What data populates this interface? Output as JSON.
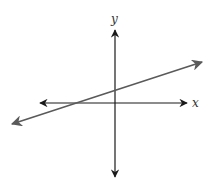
{
  "diagram": {
    "type": "coordinate-plane-line",
    "axes": {
      "x_label": "x",
      "y_label": "y",
      "color": "#1a1a1a",
      "origin_px": [
        115,
        103
      ],
      "x_axis_px": [
        40,
        187
      ],
      "y_axis_px": [
        30,
        177
      ]
    },
    "line": {
      "color": "#5a5a5a",
      "start_px": [
        12,
        124
      ],
      "end_px": [
        202,
        62
      ],
      "slope_sign": "positive",
      "y_intercept": "positive",
      "x_intercept": "negative"
    }
  }
}
